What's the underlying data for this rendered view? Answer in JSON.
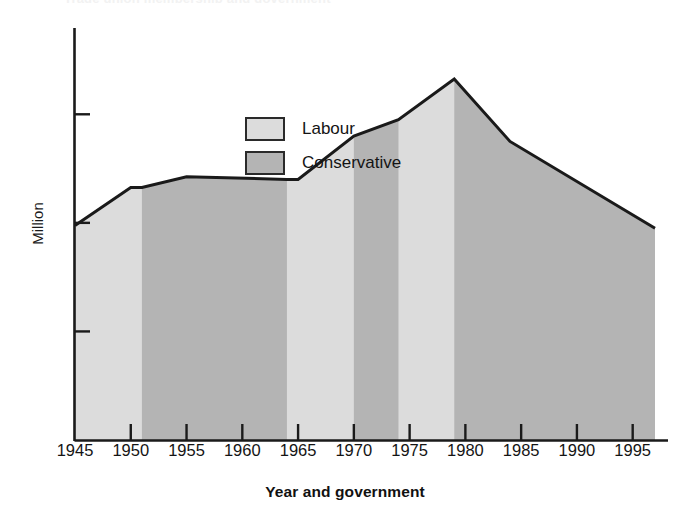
{
  "figure": {
    "clipped_title_remnant": "Trade union membership and government"
  },
  "chart_data": {
    "type": "area",
    "title": "",
    "xlabel": "Year and government",
    "ylabel": "Million",
    "xlim": [
      1945,
      1997
    ],
    "ylim": [
      0,
      14
    ],
    "grid": false,
    "y_tick_labels_shown": false,
    "y_ticks": [
      4,
      8,
      12
    ],
    "x_ticks": [
      1945,
      1950,
      1955,
      1960,
      1965,
      1970,
      1975,
      1980,
      1985,
      1990,
      1995
    ],
    "x_tick_labels": [
      "1945",
      "1950",
      "1955",
      "1960",
      "1965",
      "1970",
      "1975",
      "1980",
      "1985",
      "1990",
      "1995"
    ],
    "series": [
      {
        "name": "Trade union membership",
        "x": [
          1945,
          1950,
          1951,
          1955,
          1964,
          1965,
          1970,
          1974,
          1979,
          1984,
          1997
        ],
        "values": [
          7.9,
          9.3,
          9.3,
          9.7,
          9.6,
          9.6,
          11.2,
          11.8,
          13.3,
          11.0,
          7.8
        ]
      }
    ],
    "bands": [
      {
        "party": "Labour",
        "start": 1945,
        "end": 1951,
        "color": "#dcdcdc"
      },
      {
        "party": "Conservative",
        "start": 1951,
        "end": 1964,
        "color": "#b4b4b4"
      },
      {
        "party": "Labour",
        "start": 1964,
        "end": 1970,
        "color": "#dcdcdc"
      },
      {
        "party": "Conservative",
        "start": 1970,
        "end": 1974,
        "color": "#b4b4b4"
      },
      {
        "party": "Labour",
        "start": 1974,
        "end": 1979,
        "color": "#dcdcdc"
      },
      {
        "party": "Conservative",
        "start": 1979,
        "end": 1997,
        "color": "#b4b4b4"
      }
    ],
    "legend": {
      "position": "upper-center",
      "entries": [
        {
          "label": "Labour",
          "color": "#dcdcdc"
        },
        {
          "label": "Conservative",
          "color": "#b4b4b4"
        }
      ]
    },
    "colors": {
      "labour": "#dcdcdc",
      "conservative": "#b4b4b4",
      "line": "#1a1a1a",
      "axis": "#1a1a1a",
      "background": "#ffffff"
    }
  }
}
